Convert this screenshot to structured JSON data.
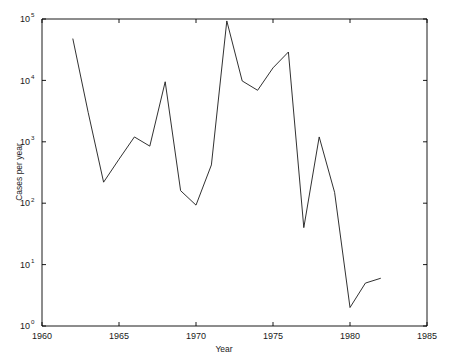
{
  "chart_data": {
    "type": "line",
    "title": "",
    "xlabel": "Year",
    "ylabel": "Cases per year",
    "xlim": [
      1960,
      1985
    ],
    "ylim": [
      1,
      100000
    ],
    "yscale": "log",
    "grid": false,
    "legend": null,
    "xticks": [
      1960,
      1965,
      1970,
      1975,
      1980,
      1985
    ],
    "xtick_labels": [
      "1960",
      "1965",
      "1970",
      "1975",
      "1980",
      "1985"
    ],
    "yticks": [
      1,
      10,
      100,
      1000,
      10000,
      100000
    ],
    "ytick_labels": [
      "10^0",
      "10^1",
      "10^2",
      "10^3",
      "10^4",
      "10^5"
    ],
    "ytick_bases": [
      "10",
      "10",
      "10",
      "10",
      "10",
      "10"
    ],
    "ytick_exponents": [
      "0",
      "1",
      "2",
      "3",
      "4",
      "5"
    ],
    "x": [
      1962,
      1963,
      1964,
      1965,
      1966,
      1967,
      1968,
      1969,
      1970,
      1971,
      1972,
      1973,
      1974,
      1975,
      1976,
      1977,
      1978,
      1979,
      1980,
      1981,
      1982
    ],
    "values": [
      48000,
      3000,
      220,
      520,
      1200,
      850,
      9500,
      160,
      93,
      420,
      93000,
      9800,
      6900,
      16000,
      29000,
      40,
      1200,
      150,
      2,
      5,
      6
    ],
    "series": [
      {
        "name": "Cases per year",
        "values": [
          48000,
          3000,
          220,
          520,
          1200,
          850,
          9500,
          160,
          93,
          420,
          93000,
          9800,
          6900,
          16000,
          29000,
          40,
          1200,
          150,
          2,
          5,
          6
        ]
      }
    ],
    "line_color": "#1a1a1a",
    "axis_color": "#000000",
    "background_color": "#ffffff"
  },
  "figure": {
    "xlabel": "Year",
    "ylabel": "Cases per year"
  }
}
